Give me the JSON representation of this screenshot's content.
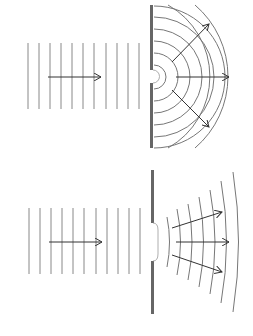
{
  "diagram": {
    "colors": {
      "wave": "#777777",
      "barrier": "#666666",
      "arrow": "#333333",
      "background": "#ffffff"
    },
    "panels": [
      {
        "name": "narrow-gap",
        "plane_wave_count": 11,
        "diffracted_arc_count": 8,
        "arrows": 3
      },
      {
        "name": "wide-gap",
        "plane_wave_count": 11,
        "diffracted_arc_count": 7,
        "arrows": 3
      }
    ]
  }
}
